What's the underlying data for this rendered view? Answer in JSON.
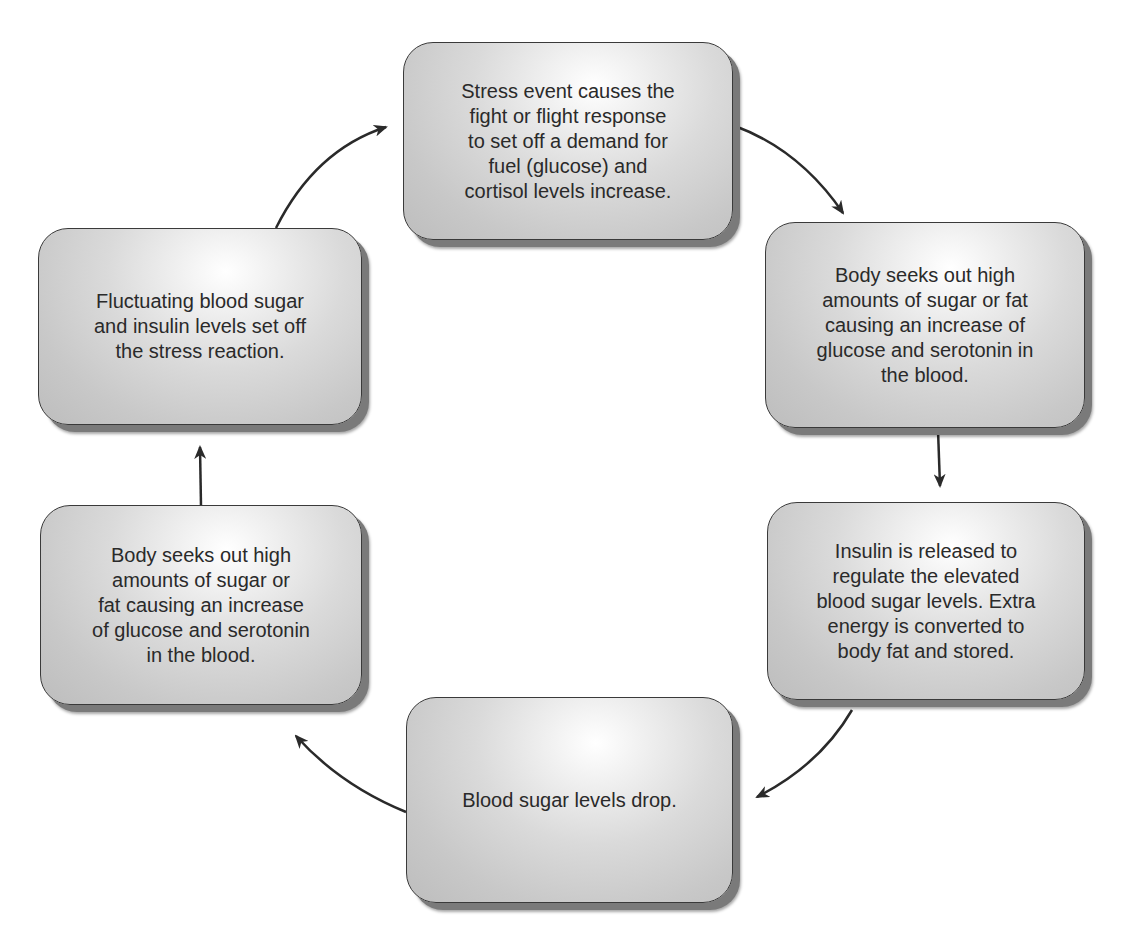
{
  "diagram": {
    "type": "cycle",
    "colors": {
      "box_border": "#3a3a3a",
      "box_shadow": "#7a7a7a",
      "arrow": "#2a2a2a",
      "text": "#2a2a2a"
    },
    "steps": [
      {
        "id": "stress-event",
        "position": "top",
        "text": "Stress event causes the\nfight or flight response\nto set off a demand for\nfuel (glucose) and\ncortisol levels increase."
      },
      {
        "id": "body-seeks-right",
        "position": "right-upper",
        "text": "Body seeks out high\namounts of sugar or fat\ncausing an increase of\nglucose and serotonin in\nthe blood."
      },
      {
        "id": "insulin-released",
        "position": "right-lower",
        "text": "Insulin is released to\nregulate the elevated\nblood sugar levels. Extra\nenergy is converted to\nbody fat and stored."
      },
      {
        "id": "blood-sugar-drop",
        "position": "bottom",
        "text": "Blood sugar levels drop."
      },
      {
        "id": "body-seeks-left",
        "position": "left-lower",
        "text": "Body seeks out high\namounts of sugar or\nfat causing an increase\nof glucose and serotonin\nin the blood."
      },
      {
        "id": "fluctuating-blood-sugar",
        "position": "left-upper",
        "text": "Fluctuating blood sugar\nand insulin levels set off\nthe stress reaction."
      }
    ],
    "arrows": [
      {
        "from": "stress-event",
        "to": "body-seeks-right"
      },
      {
        "from": "body-seeks-right",
        "to": "insulin-released"
      },
      {
        "from": "insulin-released",
        "to": "blood-sugar-drop"
      },
      {
        "from": "blood-sugar-drop",
        "to": "body-seeks-left"
      },
      {
        "from": "body-seeks-left",
        "to": "fluctuating-blood-sugar"
      },
      {
        "from": "fluctuating-blood-sugar",
        "to": "stress-event"
      }
    ]
  }
}
